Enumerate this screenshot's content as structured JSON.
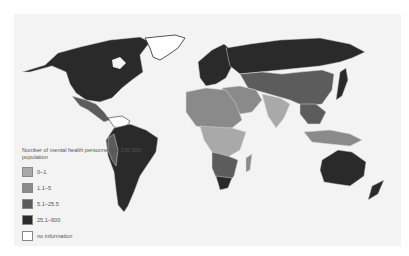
{
  "map": {
    "subject": "World map of mental health personnel density",
    "background_color": "#f3f3f3",
    "border_color": "#d8d8d8"
  },
  "legend": {
    "title": "Number of mental health personnel per 100,000 population",
    "items": [
      {
        "label": "0–1",
        "color": "#a9a9a9"
      },
      {
        "label": "1.1–5",
        "color": "#8a8a8a"
      },
      {
        "label": "5.1–25.5",
        "color": "#5c5c5c"
      },
      {
        "label": "25.1–600",
        "color": "#2a2a2a"
      },
      {
        "label": "no information",
        "color": "#ffffff"
      }
    ]
  }
}
